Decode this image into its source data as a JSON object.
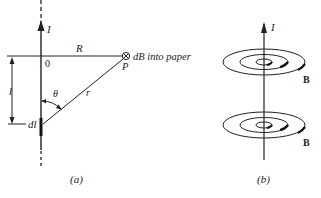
{
  "figure_a": {
    "caption": "(a)",
    "current_label": "I",
    "origin_label": "0",
    "distance_label": "R",
    "field_label": "dB into paper",
    "point_label": "P",
    "length_label": "l",
    "element_label": "dl",
    "angle_label": "θ",
    "radius_label": "r",
    "field_symbol": "⊗"
  },
  "figure_b": {
    "caption": "(b)",
    "current_label": "I",
    "field_label_top": "B",
    "field_label_bottom": "B"
  },
  "colors": {
    "ink": "#222222",
    "background": "#ffffff"
  }
}
